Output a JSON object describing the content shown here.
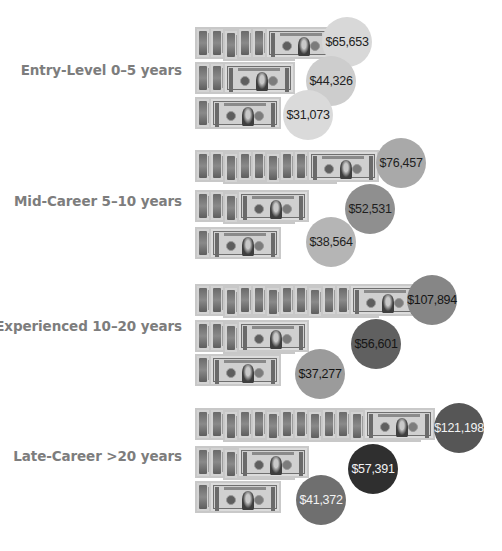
{
  "chart_data": {
    "type": "bubble-infographic",
    "title": "",
    "categories": [
      "Entry-Level 0–5 years",
      "Mid-Career 5–10 years",
      "Experienced 10–20 years",
      "Late-Career >20 years"
    ],
    "series": [
      {
        "name": "Tier 1 (top row)",
        "values": [
          65653,
          76457,
          107894,
          121198
        ]
      },
      {
        "name": "Tier 2 (middle row)",
        "values": [
          44326,
          52531,
          56601,
          57391
        ]
      },
      {
        "name": "Tier 3 (bottom row)",
        "values": [
          31073,
          38564,
          37277,
          41372
        ]
      }
    ],
    "xlabel": "",
    "ylabel": "",
    "units": "USD"
  },
  "groups": [
    {
      "label": "Entry-Level  0–5 years",
      "label_top": 62,
      "rows": [
        {
          "top": 27,
          "edges": 5,
          "value": "$65,653",
          "cx": 347,
          "cy": 42,
          "color": "#d8d8d8",
          "text_color": "#222222"
        },
        {
          "top": 62,
          "edges": 2,
          "value": "$44,326",
          "cx": 331,
          "cy": 81,
          "color": "#cdcdcd",
          "text_color": "#222222"
        },
        {
          "top": 97,
          "edges": 1,
          "value": "$31,073",
          "cx": 308,
          "cy": 115,
          "color": "#dadada",
          "text_color": "#222222"
        }
      ]
    },
    {
      "label": "Mid-Career  5–10 years",
      "label_top": 193,
      "rows": [
        {
          "top": 150,
          "edges": 8,
          "value": "$76,457",
          "cx": 401,
          "cy": 163,
          "color": "#a9a9a9",
          "text_color": "#1e1e1e"
        },
        {
          "top": 190,
          "edges": 3,
          "value": "$52,531",
          "cx": 370,
          "cy": 209,
          "color": "#8f8f8f",
          "text_color": "#1e1e1e"
        },
        {
          "top": 227,
          "edges": 1,
          "value": "$38,564",
          "cx": 331,
          "cy": 242,
          "color": "#b5b5b5",
          "text_color": "#1e1e1e"
        }
      ]
    },
    {
      "label": "Experienced 10–20 years",
      "label_top": 318,
      "rows": [
        {
          "top": 284,
          "edges": 11,
          "value": "$107,894",
          "cx": 432,
          "cy": 300,
          "color": "#868686",
          "text_color": "#151515"
        },
        {
          "top": 320,
          "edges": 3,
          "value": "$56,601",
          "cx": 376,
          "cy": 344,
          "color": "#606060",
          "text_color": "#151515"
        },
        {
          "top": 354,
          "edges": 1,
          "value": "$37,277",
          "cx": 320,
          "cy": 374,
          "color": "#9b9b9b",
          "text_color": "#151515"
        }
      ]
    },
    {
      "label": "Late-Career >20 years",
      "label_top": 448,
      "rows": [
        {
          "top": 408,
          "edges": 12,
          "value": "$121,198",
          "cx": 459,
          "cy": 428,
          "color": "#565656",
          "text_color": "#f2f2f2"
        },
        {
          "top": 446,
          "edges": 3,
          "value": "$57,391",
          "cx": 373,
          "cy": 469,
          "color": "#2f2f2f",
          "text_color": "#f2f2f2"
        },
        {
          "top": 481,
          "edges": 1,
          "value": "$41,372",
          "cx": 321,
          "cy": 500,
          "color": "#6f6f6f",
          "text_color": "#f2f2f2"
        }
      ]
    }
  ]
}
